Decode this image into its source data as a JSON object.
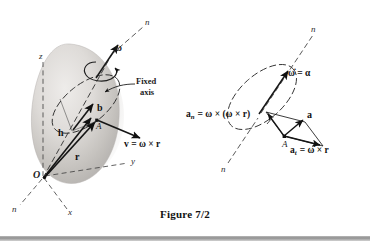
{
  "figure": {
    "caption": "Figure 7/2",
    "colors": {
      "ink": "#111111",
      "body_shade_light": "#e2e0de",
      "body_shade_mid": "#c9c6c3",
      "body_shade_dark": "#a9a5a2",
      "background": "#ffffff",
      "rule": "#8f8f8f"
    }
  },
  "left_diagram": {
    "name": "rigid-body-rotation-diagram",
    "labels": {
      "axis_n_top": "n",
      "axis_n_bottom": "n",
      "axis_z": "z",
      "axis_y": "y",
      "axis_x": "x",
      "origin": "O",
      "point_a": "A",
      "omega": "ω",
      "vector_b": "b",
      "vector_h": "h",
      "vector_r": "r",
      "fixed_axis_line1": "Fixed",
      "fixed_axis_line2": "axis",
      "velocity_equation": "v = ω × r"
    }
  },
  "right_diagram": {
    "name": "acceleration-components-diagram",
    "labels": {
      "axis_n_top": "n",
      "axis_n_bottom": "n",
      "point_a": "A",
      "alpha_equation": "ω̇ = α",
      "vector_a": "a",
      "normal_acceleration_lhs": "a",
      "normal_acceleration_sub": "n",
      "normal_acceleration_rhs": "= ω × (ω × r)",
      "tangential_acceleration_lhs": "a",
      "tangential_acceleration_sub": "t",
      "tangential_acceleration_rhs": "= ω̇ × r"
    }
  }
}
